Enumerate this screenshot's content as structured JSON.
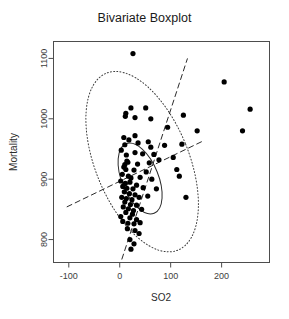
{
  "chart_data": {
    "type": "scatter",
    "title": "Bivariate Boxplot",
    "xlabel": "SO2",
    "ylabel": "Mortality",
    "xlim": [
      -130,
      294
    ],
    "ylim": [
      762,
      1128
    ],
    "grid": false,
    "legend": null,
    "xticks": [
      -100,
      0,
      100,
      200
    ],
    "xtick_labels": [
      "-100",
      "0",
      "100",
      "200"
    ],
    "yticks": [
      800,
      900,
      1000,
      1100
    ],
    "ytick_labels": [
      "800",
      "900",
      "1000",
      "1100"
    ],
    "points": [
      [
        26,
        1108
      ],
      [
        22,
        1018
      ],
      [
        51,
        1018
      ],
      [
        12,
        1009
      ],
      [
        11,
        1004
      ],
      [
        30,
        1002
      ],
      [
        61,
        1000
      ],
      [
        125,
        1006
      ],
      [
        205,
        1061
      ],
      [
        256,
        1016
      ],
      [
        94,
        986
      ],
      [
        152,
        980
      ],
      [
        241,
        980
      ],
      [
        8,
        969
      ],
      [
        30,
        972
      ],
      [
        18,
        965
      ],
      [
        56,
        962
      ],
      [
        36,
        960
      ],
      [
        10,
        957
      ],
      [
        61,
        953
      ],
      [
        88,
        956
      ],
      [
        122,
        958
      ],
      [
        3,
        948
      ],
      [
        30,
        944
      ],
      [
        13,
        940
      ],
      [
        45,
        942
      ],
      [
        67,
        941
      ],
      [
        105,
        936
      ],
      [
        14,
        930
      ],
      [
        16,
        928
      ],
      [
        10,
        924
      ],
      [
        35,
        925
      ],
      [
        58,
        927
      ],
      [
        77,
        932
      ],
      [
        8,
        920
      ],
      [
        12,
        916
      ],
      [
        28,
        915
      ],
      [
        52,
        912
      ],
      [
        112,
        916
      ],
      [
        5,
        908
      ],
      [
        17,
        905
      ],
      [
        22,
        902
      ],
      [
        40,
        903
      ],
      [
        63,
        900
      ],
      [
        2,
        897
      ],
      [
        11,
        893
      ],
      [
        20,
        895
      ],
      [
        33,
        890
      ],
      [
        6,
        888
      ],
      [
        14,
        885
      ],
      [
        26,
        884
      ],
      [
        46,
        886
      ],
      [
        72,
        884
      ],
      [
        9,
        879
      ],
      [
        19,
        876
      ],
      [
        30,
        874
      ],
      [
        55,
        872
      ],
      [
        4,
        870
      ],
      [
        13,
        868
      ],
      [
        24,
        866
      ],
      [
        38,
        870
      ],
      [
        10,
        862
      ],
      [
        21,
        858
      ],
      [
        33,
        857
      ],
      [
        7,
        854
      ],
      [
        17,
        851
      ],
      [
        27,
        848
      ],
      [
        43,
        850
      ],
      [
        12,
        845
      ],
      [
        25,
        842
      ],
      [
        2,
        838
      ],
      [
        20,
        836
      ],
      [
        33,
        833
      ],
      [
        6,
        830
      ],
      [
        16,
        827
      ],
      [
        28,
        826
      ],
      [
        40,
        828
      ],
      [
        130,
        870
      ],
      [
        117,
        905
      ],
      [
        15,
        818
      ],
      [
        30,
        815
      ],
      [
        38,
        810
      ],
      [
        20,
        800
      ],
      [
        28,
        793
      ],
      [
        22,
        784
      ]
    ],
    "hinge_ellipse": {
      "cx": 40,
      "cy": 901,
      "rx": 36,
      "ry": 62,
      "rotation_deg": -22
    },
    "fence_ellipse": {
      "cx": 44,
      "cy": 929,
      "rx": 92,
      "ry": 158,
      "rotation_deg": -22
    },
    "regression_lines": [
      {
        "name": "major-axis",
        "x1": 4,
        "y1": 767,
        "x2": 133,
        "y2": 1100
      },
      {
        "name": "minor-axis",
        "x1": -104,
        "y1": 854,
        "x2": 163,
        "y2": 963
      }
    ]
  }
}
